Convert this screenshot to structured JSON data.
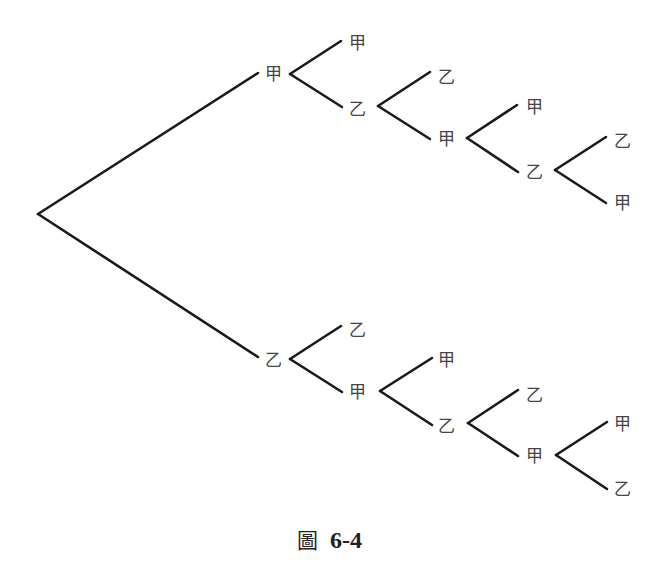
{
  "diagram": {
    "type": "tree-diagram",
    "root": {
      "x": 38,
      "y": 214
    },
    "colors": {
      "line": "#1a1a1a",
      "label": "#444444"
    },
    "edges": [
      {
        "x1": 38,
        "y1": 214,
        "x2": 258,
        "y2": 73
      },
      {
        "x1": 38,
        "y1": 214,
        "x2": 258,
        "y2": 357
      },
      {
        "x1": 290,
        "y1": 74,
        "x2": 341,
        "y2": 41
      },
      {
        "x1": 290,
        "y1": 74,
        "x2": 342,
        "y2": 107
      },
      {
        "x1": 378,
        "y1": 106,
        "x2": 430,
        "y2": 72
      },
      {
        "x1": 378,
        "y1": 106,
        "x2": 430,
        "y2": 139
      },
      {
        "x1": 467,
        "y1": 138,
        "x2": 517,
        "y2": 105
      },
      {
        "x1": 467,
        "y1": 138,
        "x2": 518,
        "y2": 172
      },
      {
        "x1": 555,
        "y1": 170,
        "x2": 606,
        "y2": 137
      },
      {
        "x1": 555,
        "y1": 170,
        "x2": 606,
        "y2": 203
      },
      {
        "x1": 290,
        "y1": 359,
        "x2": 341,
        "y2": 326
      },
      {
        "x1": 290,
        "y1": 359,
        "x2": 342,
        "y2": 392
      },
      {
        "x1": 380,
        "y1": 391,
        "x2": 432,
        "y2": 358
      },
      {
        "x1": 380,
        "y1": 391,
        "x2": 432,
        "y2": 425
      },
      {
        "x1": 468,
        "y1": 423,
        "x2": 518,
        "y2": 390
      },
      {
        "x1": 468,
        "y1": 423,
        "x2": 518,
        "y2": 456
      },
      {
        "x1": 556,
        "y1": 455,
        "x2": 607,
        "y2": 422
      },
      {
        "x1": 556,
        "y1": 455,
        "x2": 607,
        "y2": 489
      }
    ],
    "nodes": [
      {
        "id": "n1",
        "label": "甲",
        "x": 273,
        "y": 74
      },
      {
        "id": "n2",
        "label": "甲",
        "x": 357,
        "y": 43
      },
      {
        "id": "n3",
        "label": "乙",
        "x": 357,
        "y": 109
      },
      {
        "id": "n4",
        "label": "乙",
        "x": 446,
        "y": 77
      },
      {
        "id": "n5",
        "label": "甲",
        "x": 446,
        "y": 139
      },
      {
        "id": "n6",
        "label": "甲",
        "x": 534,
        "y": 107
      },
      {
        "id": "n7",
        "label": "乙",
        "x": 534,
        "y": 172
      },
      {
        "id": "n8",
        "label": "乙",
        "x": 622,
        "y": 141
      },
      {
        "id": "n9",
        "label": "甲",
        "x": 622,
        "y": 203
      },
      {
        "id": "n10",
        "label": "乙",
        "x": 273,
        "y": 360
      },
      {
        "id": "n11",
        "label": "乙",
        "x": 357,
        "y": 330
      },
      {
        "id": "n12",
        "label": "甲",
        "x": 357,
        "y": 392
      },
      {
        "id": "n13",
        "label": "甲",
        "x": 446,
        "y": 360
      },
      {
        "id": "n14",
        "label": "乙",
        "x": 446,
        "y": 426
      },
      {
        "id": "n15",
        "label": "乙",
        "x": 534,
        "y": 395
      },
      {
        "id": "n16",
        "label": "甲",
        "x": 534,
        "y": 456
      },
      {
        "id": "n17",
        "label": "甲",
        "x": 622,
        "y": 424
      },
      {
        "id": "n18",
        "label": "乙",
        "x": 622,
        "y": 489
      }
    ]
  },
  "caption": {
    "figure_char": "圖",
    "figure_number": "6-4"
  }
}
